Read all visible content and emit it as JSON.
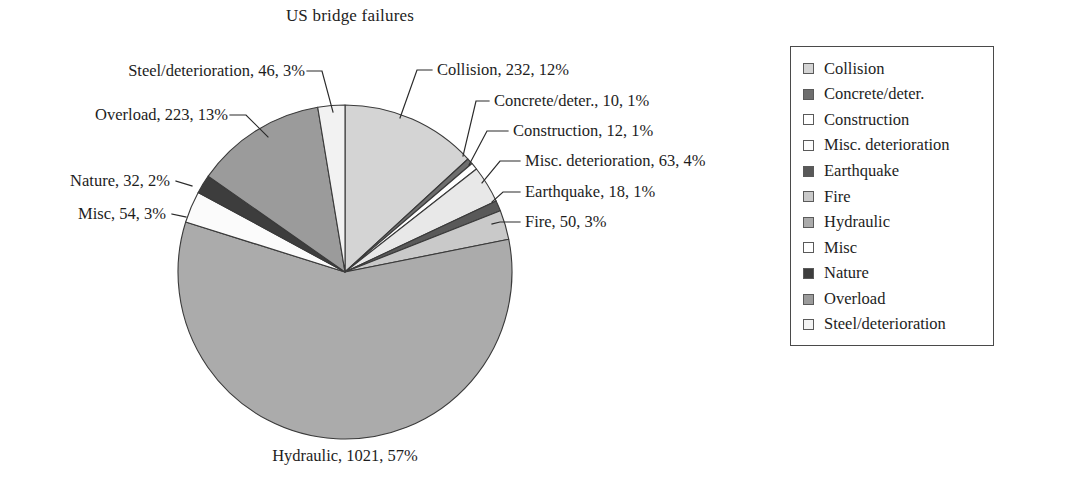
{
  "chart_data": {
    "type": "pie",
    "title": "US bridge failures",
    "xlabel": "",
    "ylabel": "",
    "total": 1761,
    "legend_position": "right",
    "grid": false,
    "categories": [
      "Collision",
      "Concrete/deter.",
      "Construction",
      "Misc. deterioration",
      "Earthquake",
      "Fire",
      "Hydraulic",
      "Misc",
      "Nature",
      "Overload",
      "Steel/deterioration"
    ],
    "values": [
      232,
      10,
      12,
      63,
      18,
      50,
      1021,
      54,
      32,
      223,
      46
    ],
    "percents": [
      12,
      1,
      1,
      4,
      1,
      3,
      57,
      3,
      2,
      13,
      3
    ],
    "colors": [
      "#d4d4d4",
      "#6e6e6e",
      "#ffffff",
      "#e8e8e8",
      "#595959",
      "#c9c9c9",
      "#ababab",
      "#fbfbfb",
      "#3d3d3d",
      "#9b9b9b",
      "#f2f2f2"
    ],
    "slice_order_clockwise_from_top": [
      "Collision",
      "Concrete/deter.",
      "Construction",
      "Misc. deterioration",
      "Earthquake",
      "Fire",
      "Hydraulic",
      "Misc",
      "Nature",
      "Overload",
      "Steel/deterioration"
    ],
    "data_labels": [
      "Collision, 232, 12%",
      "Concrete/deter., 10, 1%",
      "Construction, 12, 1%",
      "Misc. deterioration, 63, 4%",
      "Earthquake, 18, 1%",
      "Fire, 50, 3%",
      "Hydraulic, 1021, 57%",
      "Misc, 54, 3%",
      "Nature, 32, 2%",
      "Overload, 223, 13%",
      "Steel/deterioration, 46, 3%"
    ]
  },
  "title": {
    "text": "US bridge failures"
  },
  "labels": {
    "steel": "Steel/deterioration, 46, 3%",
    "overload": "Overload, 223, 13%",
    "nature": "Nature, 32, 2%",
    "misc": "Misc, 54, 3%",
    "collision": "Collision, 232, 12%",
    "concrete": "Concrete/deter., 10, 1%",
    "construction": "Construction, 12, 1%",
    "misc_deterioration": "Misc. deterioration, 63, 4%",
    "earthquake": "Earthquake, 18, 1%",
    "fire": "Fire, 50, 3%",
    "hydraulic": "Hydraulic, 1021, 57%"
  },
  "legend": {
    "items": [
      {
        "label": "Collision",
        "color": "#d4d4d4"
      },
      {
        "label": "Concrete/deter.",
        "color": "#6e6e6e"
      },
      {
        "label": "Construction",
        "color": "#ffffff"
      },
      {
        "label": "Misc. deterioration",
        "color": "#fdfdfd"
      },
      {
        "label": "Earthquake",
        "color": "#595959"
      },
      {
        "label": "Fire",
        "color": "#c9c9c9"
      },
      {
        "label": "Hydraulic",
        "color": "#ababab"
      },
      {
        "label": "Misc",
        "color": "#ffffff"
      },
      {
        "label": "Nature",
        "color": "#3d3d3d"
      },
      {
        "label": "Overload",
        "color": "#9b9b9b"
      },
      {
        "label": "Steel/deterioration",
        "color": "#f4f4f4"
      }
    ]
  }
}
